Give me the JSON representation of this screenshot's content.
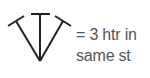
{
  "legend": {
    "symbol": {
      "icon": "three-htr-in-same-stitch-symbol",
      "stroke_color": "#222222"
    },
    "line1": "= 3 htr in",
    "line2": "same st",
    "text_color": "#555555"
  }
}
